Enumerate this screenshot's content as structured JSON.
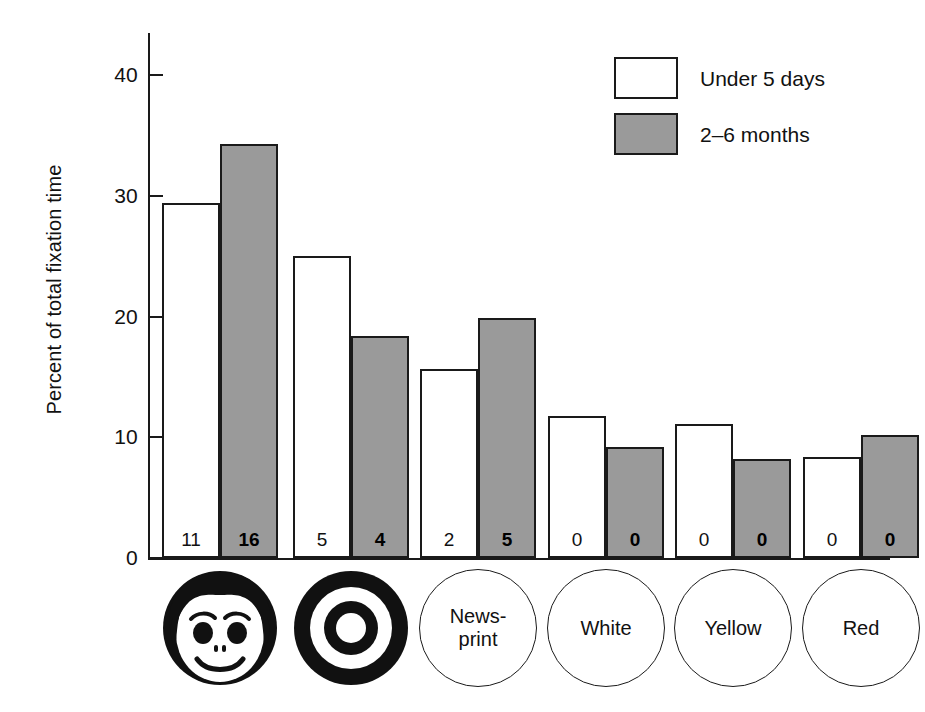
{
  "chart_data": {
    "type": "bar",
    "title": "",
    "xlabel": "",
    "ylabel": "Percent of total fixation time",
    "ylim": [
      0,
      43.5
    ],
    "yticks": [
      0,
      10,
      20,
      30,
      40
    ],
    "ytick_labels": [
      "0",
      "10",
      "20",
      "30",
      "40"
    ],
    "grid": false,
    "legend_position": "top-right",
    "categories": [
      "Face",
      "Bullseye",
      "News-print",
      "White",
      "Yellow",
      "Red"
    ],
    "category_icons": [
      "face-icon",
      "bullseye-icon",
      "text-label",
      "text-label",
      "text-label",
      "text-label"
    ],
    "series": [
      {
        "name": "Under 5 days",
        "fill": "#ffffff",
        "values": [
          29.4,
          25.0,
          15.7,
          11.8,
          11.1,
          8.4
        ],
        "counts": [
          "11",
          "5",
          "2",
          "0",
          "0",
          "0"
        ]
      },
      {
        "name": "2–6 months",
        "fill": "#9a9a9a",
        "values": [
          34.3,
          18.4,
          19.9,
          9.2,
          8.2,
          10.2
        ],
        "counts": [
          "16",
          "4",
          "5",
          "0",
          "0",
          "0"
        ]
      }
    ]
  },
  "axis": {
    "y_title": "Percent of total fixation time",
    "ticks": [
      {
        "label": "40",
        "value": 40
      },
      {
        "label": "30",
        "value": 30
      },
      {
        "label": "20",
        "value": 20
      },
      {
        "label": "10",
        "value": 10
      },
      {
        "label": "0",
        "value": 0
      }
    ]
  },
  "legend": {
    "items": [
      {
        "label": "Under 5 days",
        "swatch": "light"
      },
      {
        "label": "2–6 months",
        "swatch": "dark"
      }
    ]
  },
  "categories": [
    {
      "id": "face",
      "icon": "face-icon",
      "label": "",
      "label_line1": "",
      "label_line2": ""
    },
    {
      "id": "bullseye",
      "icon": "bullseye-icon",
      "label": "",
      "label_line1": "",
      "label_line2": ""
    },
    {
      "id": "newsprint",
      "icon": "text-label",
      "label": "News-print",
      "label_line1": "News-",
      "label_line2": "print"
    },
    {
      "id": "white",
      "icon": "text-label",
      "label": "White",
      "label_line1": "White",
      "label_line2": ""
    },
    {
      "id": "yellow",
      "icon": "text-label",
      "label": "Yellow",
      "label_line1": "Yellow",
      "label_line2": ""
    },
    {
      "id": "red",
      "icon": "text-label",
      "label": "Red",
      "label_line1": "Red",
      "label_line2": ""
    }
  ],
  "colors": {
    "ink": "#1a1a1a",
    "light_bar": "#ffffff",
    "dark_bar": "#9a9a9a",
    "background": "#ffffff"
  },
  "bars": [
    {
      "group": 0,
      "series": 0,
      "value": 29.4,
      "count": "11"
    },
    {
      "group": 0,
      "series": 1,
      "value": 34.3,
      "count": "16"
    },
    {
      "group": 1,
      "series": 0,
      "value": 25.0,
      "count": "5"
    },
    {
      "group": 1,
      "series": 1,
      "value": 18.4,
      "count": "4"
    },
    {
      "group": 2,
      "series": 0,
      "value": 15.7,
      "count": "2"
    },
    {
      "group": 2,
      "series": 1,
      "value": 19.9,
      "count": "5"
    },
    {
      "group": 3,
      "series": 0,
      "value": 11.8,
      "count": "0"
    },
    {
      "group": 3,
      "series": 1,
      "value": 9.2,
      "count": "0"
    },
    {
      "group": 4,
      "series": 0,
      "value": 11.1,
      "count": "0"
    },
    {
      "group": 4,
      "series": 1,
      "value": 8.2,
      "count": "0"
    },
    {
      "group": 5,
      "series": 0,
      "value": 8.4,
      "count": "0"
    },
    {
      "group": 5,
      "series": 1,
      "value": 10.2,
      "count": "0"
    }
  ]
}
